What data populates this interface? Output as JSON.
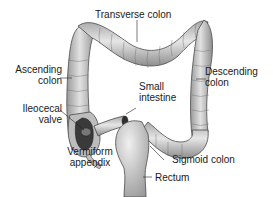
{
  "diagram": {
    "colors": {
      "tissue_fill": "#c9c9c9",
      "tissue_light": "#e4e4e4",
      "tissue_dark": "#8a8a8a",
      "outline": "#4a4a4a",
      "lumen": "#3a3a3a",
      "leader_line": "#222222",
      "text": "#1a1a1a"
    },
    "labels": {
      "transverse_colon": "Transverse colon",
      "ascending_colon_line1": "Ascending",
      "ascending_colon_line2": "colon",
      "descending_colon_line1": "Descending",
      "descending_colon_line2": "colon",
      "small_intestine_line1": "Small",
      "small_intestine_line2": "intestine",
      "ileocecal_valve_line1": "Ileocecal",
      "ileocecal_valve_line2": "valve",
      "vermiform_appendix_line1": "Vermiform",
      "vermiform_appendix_line2": "appendix",
      "sigmoid_colon": "Sigmoid colon",
      "rectum": "Rectum"
    }
  }
}
